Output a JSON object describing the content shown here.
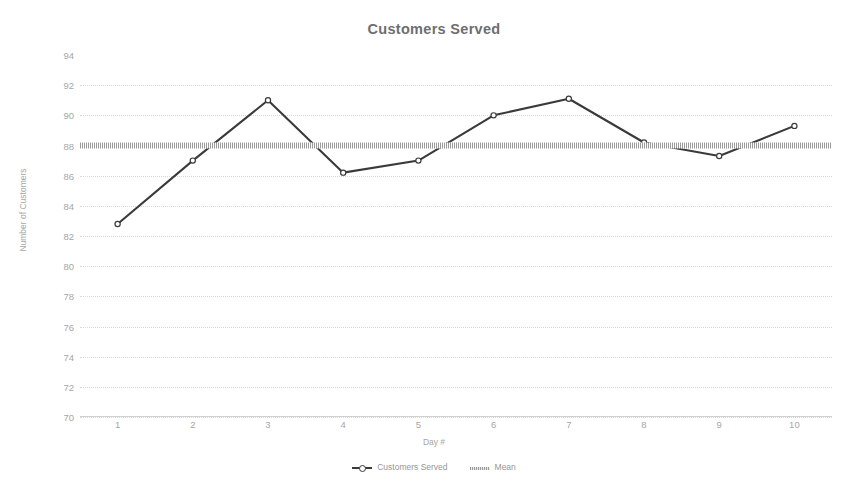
{
  "chart_data": {
    "type": "line",
    "title": "Customers Served",
    "xlabel": "Day #",
    "ylabel": "Number of Customers",
    "categories": [
      "1",
      "2",
      "3",
      "4",
      "5",
      "6",
      "7",
      "8",
      "9",
      "10"
    ],
    "x": [
      1,
      2,
      3,
      4,
      5,
      6,
      7,
      8,
      9,
      10
    ],
    "ylim": [
      70,
      94
    ],
    "ytick_values": [
      70,
      72,
      74,
      76,
      78,
      80,
      82,
      84,
      86,
      88,
      90,
      92,
      94
    ],
    "ytick_labels": [
      "70",
      "72",
      "74",
      "76",
      "78",
      "80",
      "82",
      "84",
      "86",
      "88",
      "90",
      "92",
      "94"
    ],
    "ystep": 2,
    "grid": true,
    "legend_position": "bottom",
    "series": [
      {
        "name": "Customers Served",
        "type": "line",
        "marker": "circle",
        "color": "#3a3a3a",
        "values": [
          82.8,
          87.0,
          91.0,
          86.2,
          87.0,
          90.0,
          91.1,
          88.2,
          87.3,
          89.3
        ]
      },
      {
        "name": "Mean",
        "type": "line",
        "style": "thick-hatched",
        "color": "#9a9a9a",
        "constant_value": 88.0,
        "values": [
          88.0,
          88.0,
          88.0,
          88.0,
          88.0,
          88.0,
          88.0,
          88.0,
          88.0,
          88.0
        ]
      }
    ]
  },
  "legend": {
    "entries": [
      {
        "label": "Customers Served"
      },
      {
        "label": "Mean"
      }
    ]
  },
  "colors": {
    "series_line": "#3a3a3a",
    "mean_line": "#9a9a9a",
    "grid": "#d9d9d9",
    "text": "#a6a6a6",
    "title": "#6e6e6e",
    "background": "#ffffff"
  }
}
